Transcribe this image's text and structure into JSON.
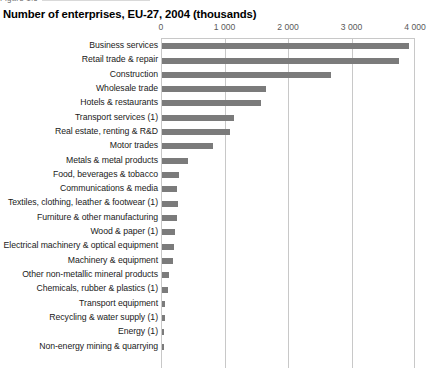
{
  "figure": {
    "caption_sliver": "Figure 1.6"
  },
  "chart_data": {
    "type": "bar",
    "orientation": "horizontal",
    "title": "Number of enterprises, EU-27, 2004 (thousands)",
    "xlabel": "",
    "ylabel": "",
    "xlim": [
      0,
      4000
    ],
    "xticks": [
      0,
      1000,
      2000,
      3000,
      4000
    ],
    "xtick_labels": [
      "0",
      "1 000",
      "2 000",
      "3 000",
      "4 000"
    ],
    "grid": true,
    "legend": "none",
    "bar_color": "#7b7b7b",
    "grid_color": "#c8c8c8",
    "categories": [
      "Business services",
      "Retail trade & repair",
      "Construction",
      "Wholesale trade",
      "Hotels & restaurants",
      "Transport services (1)",
      "Real estate, renting & R&D",
      "Motor trades",
      "Metals & metal products",
      "Food, beverages & tobacco",
      "Communications & media",
      "Textiles, clothing, leather & footwear (1)",
      "Furniture & other manufacturing",
      "Wood & paper (1)",
      "Electrical machinery & optical equipment",
      "Machinery & equipment",
      "Other non-metallic mineral products",
      "Chemicals, rubber & plastics (1)",
      "Transport equipment",
      "Recycling & water supply (1)",
      "Energy (1)",
      "Non-energy mining & quarrying"
    ],
    "values": [
      3890,
      3730,
      2660,
      1630,
      1560,
      1130,
      1070,
      800,
      410,
      275,
      235,
      250,
      230,
      210,
      190,
      170,
      115,
      95,
      45,
      40,
      30,
      25
    ]
  }
}
